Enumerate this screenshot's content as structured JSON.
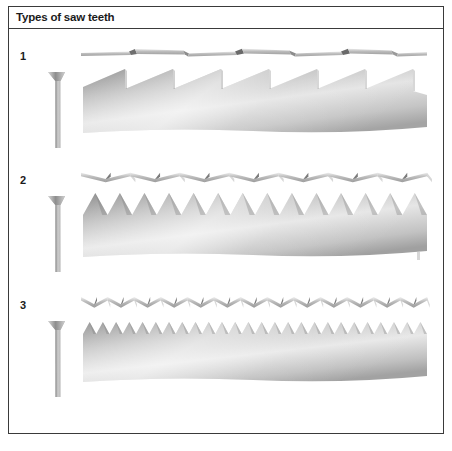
{
  "figure": {
    "title": "Types of saw teeth",
    "frame_color": "#3a3a3a",
    "background": "#ffffff",
    "width": 452,
    "height": 451
  },
  "rows": [
    {
      "number": "1",
      "tooth_count": 7,
      "tooth_style": "rip",
      "set_strip_name": "blade-set-top-view",
      "blade_name": "saw-blade-side-view",
      "cross_section_name": "blade-cross-section"
    },
    {
      "number": "2",
      "tooth_count": 14,
      "tooth_style": "crosscut",
      "set_strip_name": "blade-set-top-view",
      "blade_name": "saw-blade-side-view",
      "cross_section_name": "blade-cross-section"
    },
    {
      "number": "3",
      "tooth_count": 26,
      "tooth_style": "fine",
      "set_strip_name": "blade-set-top-view",
      "blade_name": "saw-blade-side-view",
      "cross_section_name": "blade-cross-section"
    }
  ],
  "colors": {
    "steel_light": "#f2f2f2",
    "steel_mid": "#c2c2c2",
    "steel_dark": "#8f8f8f",
    "steel_shadow": "#6d6d6d",
    "ink": "#1b1b1b"
  }
}
